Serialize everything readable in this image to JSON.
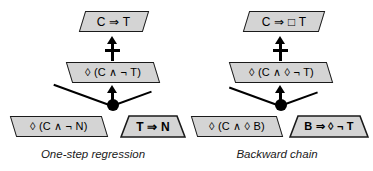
{
  "figure": {
    "type": "diagram",
    "kind": "proof-tree / inference diagram",
    "panels": [
      {
        "id": "one-step-regression",
        "caption": "One-step regression",
        "nodes": {
          "conclusion": "C ⇒ T",
          "middle": "◊ (C ∧ ¬ T)",
          "premise_left": "◊ (C ∧ ¬ N)",
          "premise_right": "T ⇒ N"
        },
        "connectors": {
          "upper_arrow": "crossed-up-arrow",
          "lower_arrow": "up-arrow",
          "join": "filled-dot"
        }
      },
      {
        "id": "backward-chain",
        "caption": "Backward chain",
        "nodes": {
          "conclusion": "C ⇒ □ T",
          "middle": "◊ (C ∧ ◊ ¬ T)",
          "premise_left": "◊ (C ∧ ◊ B)",
          "premise_right": "B ⇒ ◊ ¬ T"
        },
        "connectors": {
          "upper_arrow": "crossed-up-arrow",
          "lower_arrow": "up-arrow",
          "join": "filled-dot"
        }
      }
    ],
    "colors": {
      "node_fill": "#d4d4d4",
      "node_border": "#1a1a1a",
      "connector": "#000000",
      "background": "#ffffff"
    }
  }
}
